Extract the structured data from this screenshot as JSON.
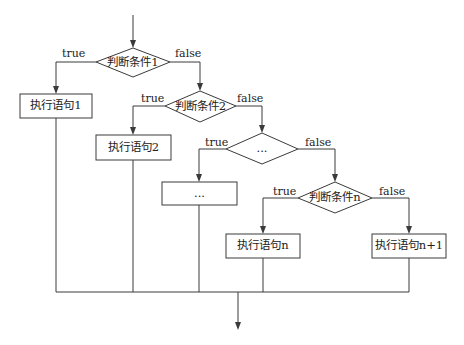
{
  "diagram": {
    "type": "flowchart",
    "colors": {
      "line": "#3a3a3a",
      "background": "#ffffff",
      "text": "#222222"
    },
    "decisions": [
      {
        "id": "d1",
        "label": "判断条件1",
        "true_label": "true",
        "false_label": "false"
      },
      {
        "id": "d2",
        "label": "判断条件2",
        "true_label": "true",
        "false_label": "false"
      },
      {
        "id": "d3",
        "label": "...",
        "true_label": "true",
        "false_label": "false"
      },
      {
        "id": "dn",
        "label": "判断条件n",
        "true_label": "true",
        "false_label": "false"
      }
    ],
    "processes": [
      {
        "id": "p1",
        "label": "执行语句1"
      },
      {
        "id": "p2",
        "label": "执行语句2"
      },
      {
        "id": "p3",
        "label": "..."
      },
      {
        "id": "pn",
        "label": "执行语句n"
      },
      {
        "id": "pn1",
        "label": "执行语句n+1"
      }
    ],
    "edges": [
      {
        "from": "start",
        "to": "d1"
      },
      {
        "from": "d1",
        "to": "p1",
        "label": "true"
      },
      {
        "from": "d1",
        "to": "d2",
        "label": "false"
      },
      {
        "from": "d2",
        "to": "p2",
        "label": "true"
      },
      {
        "from": "d2",
        "to": "d3",
        "label": "false"
      },
      {
        "from": "d3",
        "to": "p3",
        "label": "true"
      },
      {
        "from": "d3",
        "to": "dn",
        "label": "false"
      },
      {
        "from": "dn",
        "to": "pn",
        "label": "true"
      },
      {
        "from": "dn",
        "to": "pn1",
        "label": "false"
      },
      {
        "from": "p1",
        "to": "end"
      },
      {
        "from": "p2",
        "to": "end"
      },
      {
        "from": "p3",
        "to": "end"
      },
      {
        "from": "pn",
        "to": "end"
      },
      {
        "from": "pn1",
        "to": "end"
      }
    ]
  }
}
